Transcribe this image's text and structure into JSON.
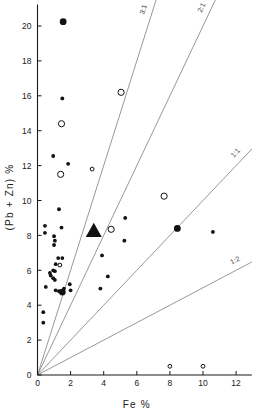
{
  "chart_data": {
    "type": "scatter",
    "title": "",
    "xlabel": "Fe %",
    "ylabel": "(Pb + Zn) %",
    "xlim": [
      0,
      13
    ],
    "ylim": [
      0,
      21
    ],
    "xticks": [
      0,
      2,
      4,
      6,
      8,
      10,
      12
    ],
    "xtick_labels": [
      "0",
      "2",
      "4",
      "6",
      "8",
      "10",
      "12"
    ],
    "yticks": [
      0,
      2,
      4,
      6,
      8,
      10,
      12,
      14,
      16,
      18,
      20
    ],
    "ytick_labels": [
      "0",
      "2",
      "4",
      "6",
      "8",
      "10",
      "12",
      "14",
      "16",
      "18",
      "20"
    ],
    "grid": false,
    "legend": "none",
    "reference_lines": [
      {
        "label": "3:1",
        "slope": 3.0,
        "intercept": 0
      },
      {
        "label": "2:1",
        "slope": 2.0,
        "intercept": 0
      },
      {
        "label": "1:1",
        "slope": 1.0,
        "intercept": 0
      },
      {
        "label": "1:2",
        "slope": 0.5,
        "intercept": 0
      }
    ],
    "series": [
      {
        "name": "small filled circles",
        "marker": "filled-circle",
        "size": 3.0,
        "points": [
          {
            "x": 1.5,
            "y": 15.85
          },
          {
            "x": 0.95,
            "y": 12.55
          },
          {
            "x": 1.85,
            "y": 12.1
          },
          {
            "x": 1.3,
            "y": 9.5
          },
          {
            "x": 0.45,
            "y": 8.55
          },
          {
            "x": 1.45,
            "y": 8.45
          },
          {
            "x": 0.45,
            "y": 8.15
          },
          {
            "x": 1.0,
            "y": 7.95
          },
          {
            "x": 1.05,
            "y": 7.7
          },
          {
            "x": 1.0,
            "y": 7.45
          },
          {
            "x": 5.3,
            "y": 9.0
          },
          {
            "x": 5.25,
            "y": 7.7
          },
          {
            "x": 10.6,
            "y": 8.2
          },
          {
            "x": 1.25,
            "y": 6.7
          },
          {
            "x": 1.5,
            "y": 6.7
          },
          {
            "x": 1.1,
            "y": 6.35
          },
          {
            "x": 1.35,
            "y": 6.3
          },
          {
            "x": 0.95,
            "y": 6.0
          },
          {
            "x": 1.05,
            "y": 5.95
          },
          {
            "x": 0.75,
            "y": 5.85
          },
          {
            "x": 0.8,
            "y": 5.7
          },
          {
            "x": 0.95,
            "y": 5.55
          },
          {
            "x": 1.05,
            "y": 5.45
          },
          {
            "x": 3.9,
            "y": 6.85
          },
          {
            "x": 4.25,
            "y": 5.65
          },
          {
            "x": 3.8,
            "y": 4.95
          },
          {
            "x": 0.5,
            "y": 5.05
          },
          {
            "x": 1.1,
            "y": 4.85
          },
          {
            "x": 1.3,
            "y": 4.8
          },
          {
            "x": 1.45,
            "y": 4.75
          },
          {
            "x": 1.6,
            "y": 4.95
          },
          {
            "x": 2.0,
            "y": 4.85
          },
          {
            "x": 1.95,
            "y": 5.2
          },
          {
            "x": 0.35,
            "y": 3.6
          },
          {
            "x": 0.35,
            "y": 3.0
          }
        ]
      },
      {
        "name": "large filled circles",
        "marker": "filled-circle",
        "size": 6.0,
        "points": [
          {
            "x": 1.55,
            "y": 20.25
          },
          {
            "x": 8.45,
            "y": 8.4
          },
          {
            "x": 1.5,
            "y": 4.75
          }
        ]
      },
      {
        "name": "large open circles",
        "marker": "open-circle",
        "size": 5.0,
        "points": [
          {
            "x": 1.45,
            "y": 14.4
          },
          {
            "x": 5.05,
            "y": 16.2
          },
          {
            "x": 1.4,
            "y": 11.5
          },
          {
            "x": 7.65,
            "y": 10.25
          },
          {
            "x": 4.45,
            "y": 8.35
          }
        ]
      },
      {
        "name": "small open circles",
        "marker": "open-circle",
        "size": 2.6,
        "points": [
          {
            "x": 3.3,
            "y": 11.8
          },
          {
            "x": 1.35,
            "y": 6.3
          },
          {
            "x": 8.0,
            "y": 0.5
          },
          {
            "x": 10.0,
            "y": 0.5
          }
        ]
      },
      {
        "name": "filled triangle",
        "marker": "filled-triangle",
        "size": 8.0,
        "points": [
          {
            "x": 3.4,
            "y": 8.25
          }
        ]
      }
    ]
  },
  "axes": {
    "x_axis_name": "Fe %",
    "y_axis_name": "(Pb + Zn) %"
  }
}
